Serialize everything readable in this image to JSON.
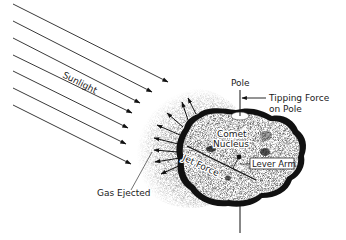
{
  "diagram": {
    "labels": {
      "sunlight": "Sunlight",
      "pole": "Pole",
      "tipping_force_line1": "Tipping Force",
      "tipping_force_line2": "on Pole",
      "comet_line1": "Comet",
      "comet_line2": "Nucleus",
      "jet_force": "Jet Force",
      "lever_arm": "Lever Arm",
      "gas_ejected": "Gas Ejected"
    },
    "sunlight_rays": [
      {
        "x1": 13,
        "y1": 4,
        "x2": 168,
        "y2": 82
      },
      {
        "x1": 13,
        "y1": 21,
        "x2": 152,
        "y2": 92
      },
      {
        "x1": 13,
        "y1": 38,
        "x2": 140,
        "y2": 103
      },
      {
        "x1": 13,
        "y1": 55,
        "x2": 132,
        "y2": 113
      },
      {
        "x1": 13,
        "y1": 71,
        "x2": 128,
        "y2": 128
      },
      {
        "x1": 13,
        "y1": 88,
        "x2": 126,
        "y2": 144
      },
      {
        "x1": 13,
        "y1": 105,
        "x2": 131,
        "y2": 164
      }
    ],
    "gas_jets": [
      {
        "x1": 196,
        "y1": 114,
        "x2": 188,
        "y2": 98
      },
      {
        "x1": 188,
        "y1": 120,
        "x2": 182,
        "y2": 102
      },
      {
        "x1": 183,
        "y1": 127,
        "x2": 167,
        "y2": 113
      },
      {
        "x1": 180,
        "y1": 135,
        "x2": 157,
        "y2": 125
      },
      {
        "x1": 178,
        "y1": 144,
        "x2": 154,
        "y2": 138
      },
      {
        "x1": 178,
        "y1": 152,
        "x2": 154,
        "y2": 150
      },
      {
        "x1": 180,
        "y1": 158,
        "x2": 155,
        "y2": 162
      },
      {
        "x1": 183,
        "y1": 164,
        "x2": 161,
        "y2": 174
      }
    ],
    "colors": {
      "ink": "#111111",
      "paper": "#ffffff",
      "stipple": "#555555"
    }
  }
}
